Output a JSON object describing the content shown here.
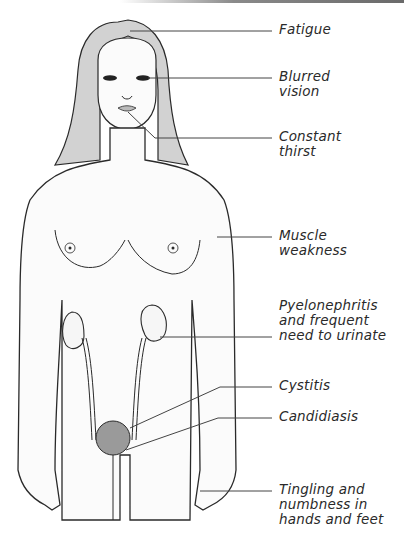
{
  "diagram": {
    "colors": {
      "ink": "#2a2a2a",
      "hair": "#cfcfcf",
      "skin": "#fbfbfb",
      "line": "#444444"
    },
    "labels": [
      {
        "id": "fatigue",
        "text": "Fatigue",
        "top": 22,
        "line_y": 31
      },
      {
        "id": "blurred-vision",
        "text": "Blurred\nvision",
        "top": 69,
        "line_y": 78
      },
      {
        "id": "constant-thirst",
        "text": "Constant\nthirst",
        "top": 129,
        "line_y": 138
      },
      {
        "id": "muscle-weakness",
        "text": "Muscle\nweakness",
        "top": 228,
        "line_y": 237
      },
      {
        "id": "pyelonephritis",
        "text": "Pyelonephritis\nand frequent\nneed to urinate",
        "top": 298,
        "line_y": 337
      },
      {
        "id": "cystitis",
        "text": "Cystitis",
        "top": 378,
        "line_y": 387
      },
      {
        "id": "candidiasis",
        "text": "Candidiasis",
        "top": 409,
        "line_y": 418
      },
      {
        "id": "tingling",
        "text": "Tingling and\nnumbness in\nhands and feet",
        "top": 482,
        "line_y": 491
      }
    ]
  }
}
